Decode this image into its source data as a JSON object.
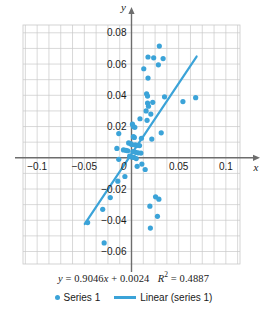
{
  "chart_data": {
    "type": "scatter",
    "title": "",
    "xlabel": "x",
    "ylabel": "y",
    "xlim": [
      -0.115,
      0.115
    ],
    "ylim": [
      -0.068,
      0.085
    ],
    "grid": true,
    "x_ticks": [
      -0.1,
      -0.05,
      0,
      0.05,
      0.1
    ],
    "x_tick_labels": [
      "−0.1",
      "−0.05",
      "0",
      "0.05",
      "0.1"
    ],
    "y_ticks": [
      -0.06,
      -0.04,
      -0.02,
      0.02,
      0.04,
      0.06,
      0.08
    ],
    "y_tick_labels": [
      "−0.06",
      "−0.04",
      "−0.02",
      "0.02",
      "0.04",
      "0.06",
      "0.08"
    ],
    "grid_step_x": 0.0125,
    "grid_step_y": 0.01,
    "marker_color": "#3BA3D8",
    "line_color": "#3BA3D8",
    "grid_color": "#c9c9c9",
    "axis_color": "#6d6d6d",
    "series": [
      {
        "name": "Series 1",
        "type": "scatter",
        "points": [
          [
            0.0295,
            0.0715
          ],
          [
            0.0175,
            0.0645
          ],
          [
            0.0235,
            0.064
          ],
          [
            0.0335,
            0.0635
          ],
          [
            0.0285,
            0.0595
          ],
          [
            0.013,
            0.057
          ],
          [
            0.0175,
            0.051
          ],
          [
            0.016,
            0.041
          ],
          [
            0.017,
            0.0395
          ],
          [
            0.035,
            0.039
          ],
          [
            0.068,
            0.0385
          ],
          [
            0.0545,
            0.036
          ],
          [
            0.0225,
            0.0355
          ],
          [
            0.017,
            0.035
          ],
          [
            0.018,
            0.033
          ],
          [
            0.0155,
            0.03
          ],
          [
            0.0205,
            0.028
          ],
          [
            0.009,
            0.025
          ],
          [
            0.0165,
            0.024
          ],
          [
            0.001,
            0.0215
          ],
          [
            0.002,
            0.02
          ],
          [
            0.0035,
            0.0195
          ],
          [
            0.0315,
            0.016
          ],
          [
            -0.0135,
            0.0155
          ],
          [
            0.002,
            0.0135
          ],
          [
            0.003,
            0.013
          ],
          [
            0.0105,
            0.0125
          ],
          [
            0.0215,
            0.012
          ],
          [
            -0.003,
            0.0095
          ],
          [
            -0.001,
            0.009
          ],
          [
            0.0005,
            0.0085
          ],
          [
            0.004,
            0.0082
          ],
          [
            0.006,
            0.008
          ],
          [
            0.0085,
            0.0078
          ],
          [
            -0.0155,
            0.006
          ],
          [
            -0.0085,
            0.005
          ],
          [
            -0.006,
            0.0048
          ],
          [
            -0.004,
            0.0045
          ],
          [
            0.0015,
            0.004
          ],
          [
            0.0045,
            0.0035
          ],
          [
            0.007,
            0.0032
          ],
          [
            0.01,
            0.003
          ],
          [
            -0.002,
            0.001
          ],
          [
            0.0,
            0.0005
          ],
          [
            0.0025,
            0.0002
          ],
          [
            0.005,
            -0.0005
          ],
          [
            -0.0135,
            -0.001
          ],
          [
            0.011,
            -0.004
          ],
          [
            0.006,
            -0.0055
          ],
          [
            0.0145,
            -0.0075
          ],
          [
            -0.007,
            -0.012
          ],
          [
            -0.0145,
            -0.015
          ],
          [
            0.0255,
            -0.025
          ],
          [
            -0.0225,
            -0.0255
          ],
          [
            0.029,
            -0.0265
          ],
          [
            0.0195,
            -0.031
          ],
          [
            -0.0305,
            -0.033
          ],
          [
            0.0275,
            -0.0375
          ],
          [
            -0.0465,
            -0.0415
          ],
          [
            0.02,
            -0.045
          ],
          [
            -0.029,
            -0.0545
          ]
        ]
      },
      {
        "name": "Linear (series 1)",
        "type": "line",
        "fit": {
          "slope": 0.9046,
          "intercept": 0.0024,
          "r_squared": 0.4887,
          "x_start": -0.0495,
          "x_end": 0.069
        }
      }
    ],
    "annotation": {
      "equation_y": "y",
      "equation_eq": "=",
      "equation_slope": "0.9046",
      "equation_x": "x",
      "equation_plus": "+",
      "equation_intercept": "0.0024",
      "r_label": "R",
      "r_exponent": "2",
      "r_eq": "=",
      "r_value": "0.4887",
      "full_text": "y = 0.9046x + 0.0024   R2 = 0.4887"
    },
    "legend": {
      "position": "bottom",
      "entries": [
        {
          "label": "Series 1",
          "marker": "dot",
          "color": "#3BA3D8"
        },
        {
          "label": "Linear (series 1)",
          "marker": "line",
          "color": "#3BA3D8"
        }
      ]
    }
  }
}
